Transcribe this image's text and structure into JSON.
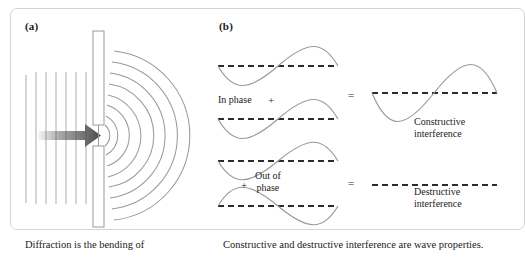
{
  "figure": {
    "panel_a": {
      "label": "(a)",
      "caption": "Diffraction is the bending of",
      "elements": {
        "plane_wave_lines": 7,
        "barrier_top_label": "barrier-top",
        "barrier_bottom_label": "barrier-bottom",
        "slit_label": "slit-gap",
        "arrow_label": "wave-direction-arrow",
        "diffracted_arcs": 8
      }
    },
    "panel_b": {
      "label": "(b)",
      "caption": "Constructive and destructive interference are wave properties.",
      "in_phase": {
        "label": "In phase",
        "plus": "+",
        "equals": "=",
        "result_line1": "Constructive",
        "result_line2": "interference"
      },
      "out_of_phase": {
        "label_line1": "Out of",
        "label_line2": "phase",
        "plus": "+",
        "equals": "=",
        "result_line1": "Destructive",
        "result_line2": "interference"
      }
    }
  },
  "colors": {
    "wave_gray": "#9a9a9a",
    "dash_black": "#2b2b2b",
    "arrow_gray": "#5f5f5f",
    "frame_gray": "#d4d4d4",
    "text_black": "#1a1a1a"
  }
}
